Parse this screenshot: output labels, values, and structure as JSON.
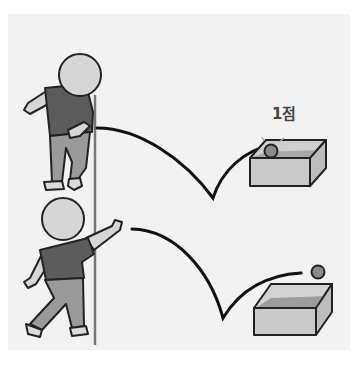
{
  "figure": {
    "score_label": "1점",
    "colors": {
      "background": "#f2f2f2",
      "outline": "#222222",
      "skin": "#d6d6d6",
      "shirt": "#5c5c5c",
      "pants": "#9a9a9a",
      "shoes": "#dcdcdc",
      "line": "#777777",
      "box_front": "#c9c9c9",
      "box_side": "#bdbdbd",
      "box_inner": "#9c9c9c",
      "ball": "#8a8a8a",
      "trajectory": "#111111"
    },
    "scenes": [
      {
        "name": "top",
        "player_pose": "underhand-throw",
        "outcome": "ball lands in box after one bounce",
        "score": "1점"
      },
      {
        "name": "bottom",
        "player_pose": "overhand-throw",
        "outcome": "ball bounces toward box"
      }
    ]
  }
}
